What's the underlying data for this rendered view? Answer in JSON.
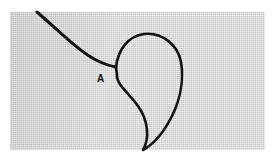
{
  "image": {
    "description": "Embroidery thread forming a teardrop-shaped loop on woven fabric",
    "labels": [
      {
        "id": "A",
        "text": "A"
      }
    ],
    "colors": {
      "fabric": "#dcdcdc",
      "thread": "#111111",
      "background": "#ffffff"
    }
  }
}
